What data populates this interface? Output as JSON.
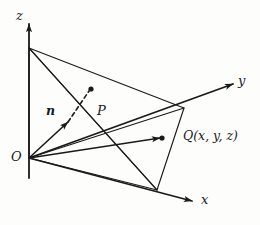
{
  "figure": {
    "background_color": "#fdfdfc",
    "ink_color": "#1a1a1a",
    "width": 260,
    "height": 225,
    "axes": [
      {
        "name": "z-axis",
        "label": "z",
        "label_x": 16,
        "label_y": 9,
        "from": [
          29,
          178
        ],
        "to": [
          29,
          24
        ]
      },
      {
        "name": "y-axis",
        "label": "y",
        "label_x": 238,
        "label_y": 74,
        "from": [
          29,
          158
        ],
        "to": [
          233,
          84
        ]
      },
      {
        "name": "x-axis",
        "label": "x",
        "label_x": 201,
        "label_y": 193,
        "from": [
          29,
          158
        ],
        "to": [
          192,
          201
        ]
      }
    ],
    "points": [
      {
        "name": "origin",
        "label": "O",
        "label_x": 11,
        "label_y": 150,
        "x": 29,
        "y": 158,
        "dot": false
      },
      {
        "name": "point-p",
        "label": "P",
        "label_x": 97,
        "label_y": 104,
        "x": 91,
        "y": 89,
        "dot": true
      },
      {
        "name": "point-q",
        "label": "Q(x, y, z)",
        "label_x": 183,
        "label_y": 130,
        "x": 162,
        "y": 138,
        "dot": true
      }
    ],
    "vectors": [
      {
        "name": "normal-vector-n",
        "label": "n",
        "label_x": 46,
        "label_y": 105,
        "from": [
          29,
          158
        ],
        "to": [
          68,
          122
        ],
        "style": "solid",
        "arrow": true
      },
      {
        "name": "normal-vector-n-dashed",
        "from": [
          68,
          122
        ],
        "to": [
          89,
          91
        ],
        "style": "dashed",
        "arrow": false
      },
      {
        "name": "position-vector-oq",
        "from": [
          29,
          158
        ],
        "to": [
          160,
          138
        ],
        "style": "solid",
        "arrow": true
      }
    ],
    "plane_triangle": {
      "name": "plane-triangle",
      "vertices": [
        [
          29,
          48
        ],
        [
          184,
          108
        ],
        [
          157,
          190
        ]
      ]
    },
    "construction_lines": [
      {
        "name": "line-o-to-z-intercept",
        "from": [
          29,
          48
        ],
        "to": [
          29,
          158
        ]
      },
      {
        "name": "line-o-to-y-intercept",
        "from": [
          29,
          158
        ],
        "to": [
          184,
          108
        ]
      },
      {
        "name": "line-o-to-x-intercept",
        "from": [
          29,
          158
        ],
        "to": [
          157,
          190
        ]
      },
      {
        "name": "line-z-intercept-to-x-intercept",
        "from": [
          29,
          48
        ],
        "to": [
          157,
          190
        ]
      }
    ]
  }
}
